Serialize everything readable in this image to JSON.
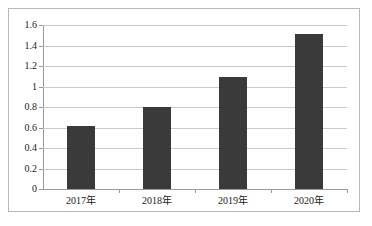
{
  "chart_data": {
    "type": "bar",
    "title": "",
    "subtitle": "",
    "xlabel": "",
    "ylabel": "",
    "categories": [
      "2017年",
      "2018年",
      "2019年",
      "2020年"
    ],
    "values": [
      0.61,
      0.8,
      1.09,
      1.51
    ],
    "series": [
      {
        "name": "",
        "values": [
          0.61,
          0.8,
          1.09,
          1.51
        ]
      }
    ],
    "ylim": [
      0,
      1.6
    ],
    "ytick_labels": [
      "0",
      "0.2",
      "0.4",
      "0.6",
      "0.8",
      "1",
      "1.2",
      "1.4",
      "1.6"
    ],
    "ytick_values": [
      0,
      0.2,
      0.4,
      0.6,
      0.8,
      1,
      1.2,
      1.4,
      1.6
    ],
    "grid": true,
    "legend": false,
    "legend_position": "none",
    "annotations": [],
    "colors": {
      "bar": "#3a3a3a",
      "gridline": "#c9c9c9",
      "axis": "#9a9a9a",
      "frame": "#b8b8b8",
      "background": "#ffffff",
      "text": "#1a1a1a"
    }
  }
}
